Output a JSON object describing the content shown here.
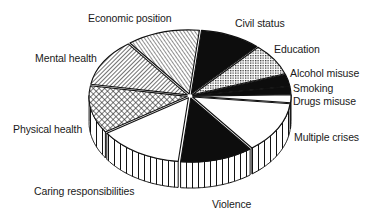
{
  "chart_data": {
    "type": "pie",
    "style": "3d-exploded",
    "title": "",
    "legend": "none (labels placed beside slices)",
    "start_angle_deg": 84,
    "direction": "clockwise",
    "slices": [
      {
        "label": "Civil status",
        "value": 10,
        "fill": "black"
      },
      {
        "label": "Education",
        "value": 8,
        "fill": "dots"
      },
      {
        "label": "Alcohol misuse",
        "value": 3,
        "fill": "black"
      },
      {
        "label": "Smoking",
        "value": 2,
        "fill": "black"
      },
      {
        "label": "Drugs misuse",
        "value": 2,
        "fill": "white"
      },
      {
        "label": "Multiple crises",
        "value": 13,
        "fill": "white"
      },
      {
        "label": "Violence",
        "value": 12,
        "fill": "black"
      },
      {
        "label": "Caring responsibilities",
        "value": 14,
        "fill": "white"
      },
      {
        "label": "Physical health",
        "value": 12,
        "fill": "crosshatch"
      },
      {
        "label": "Mental health",
        "value": 12,
        "fill": "diagonal-hatch"
      },
      {
        "label": "Economic position",
        "value": 12,
        "fill": "diagonal-hatch-fine"
      }
    ],
    "categories": [
      "Civil status",
      "Education",
      "Alcohol misuse",
      "Smoking",
      "Drugs misuse",
      "Multiple crises",
      "Violence",
      "Caring responsibilities",
      "Physical health",
      "Mental health",
      "Economic position"
    ],
    "values": [
      10,
      8,
      3,
      2,
      2,
      13,
      12,
      14,
      12,
      12,
      12
    ]
  },
  "labels": {
    "economic_position": "Economic position",
    "civil_status": "Civil status",
    "education": "Education",
    "alcohol_misuse": "Alcohol misuse",
    "smoking": "Smoking",
    "drugs_misuse": "Drugs misuse",
    "multiple_crises": "Multiple crises",
    "violence": "Violence",
    "caring_responsibilities": "Caring responsibilities",
    "physical_health": "Physical health",
    "mental_health": "Mental health"
  }
}
